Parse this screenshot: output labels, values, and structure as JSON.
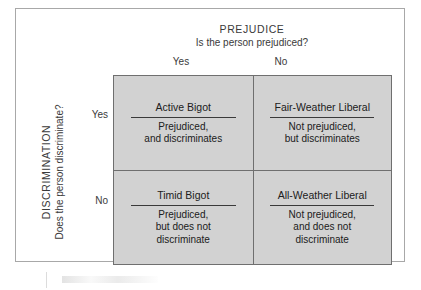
{
  "figure": {
    "column_axis": {
      "title": "PREJUDICE",
      "question": "Is the person prejudiced?",
      "ticks": [
        "Yes",
        "No"
      ]
    },
    "row_axis": {
      "title": "DISCRIMINATION",
      "question": "Does the person discriminate?",
      "ticks": [
        "Yes",
        "No"
      ]
    },
    "cells": [
      {
        "title": "Active Bigot",
        "description": "Prejudiced,\nand discriminates"
      },
      {
        "title": "Fair-Weather Liberal",
        "description": "Not prejudiced,\nbut discriminates"
      },
      {
        "title": "Timid Bigot",
        "description": "Prejudiced,\nbut does not\ndiscriminate"
      },
      {
        "title": "All-Weather Liberal",
        "description": "Not prejudiced,\nand does not\ndiscriminate"
      }
    ],
    "colors": {
      "cell_fill": "#d2d2d2",
      "grid_line": "#6f6f6f",
      "outer_frame": "#a8a8a8",
      "text": "#202020"
    }
  }
}
